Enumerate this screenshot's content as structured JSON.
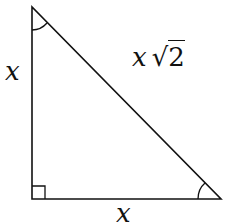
{
  "diagram": {
    "type": "right-isosceles-triangle",
    "vertices": {
      "top": [
        32,
        7
      ],
      "right_angle": [
        32,
        199
      ],
      "bottom_right": [
        221,
        199
      ]
    },
    "labels": {
      "left_leg": "x",
      "bottom_leg": "x",
      "hypotenuse_var": "x",
      "hypotenuse_radical_sign": "√",
      "hypotenuse_radicand": "2"
    },
    "markers": [
      "right-angle-square",
      "angle-arc-top",
      "angle-arc-bottom-right"
    ],
    "stroke_color": "#111111",
    "background": "#ffffff"
  }
}
